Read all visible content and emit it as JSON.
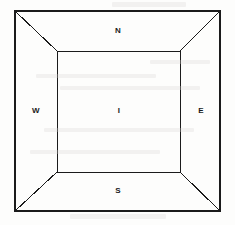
{
  "figure": {
    "kind": "one-point-perspective-room-diagram",
    "background_color": "#fdfdfc",
    "line_color": "#1b1b1b",
    "outer_rect": {
      "x1": 15,
      "y1": 11,
      "x2": 220,
      "y2": 211,
      "stroke_width": 2
    },
    "inner_rect": {
      "x1": 57,
      "y1": 51,
      "x2": 180,
      "y2": 172,
      "stroke_width": 1
    },
    "diagonals": [
      {
        "name": "top-left-diagonal",
        "x1": 15,
        "y1": 11,
        "x2": 57,
        "y2": 51
      },
      {
        "name": "top-right-diagonal",
        "x1": 220,
        "y1": 11,
        "x2": 180,
        "y2": 51
      },
      {
        "name": "bottom-left-diagonal",
        "x1": 15,
        "y1": 211,
        "x2": 57,
        "y2": 172
      },
      {
        "name": "bottom-right-diagonal",
        "x1": 220,
        "y1": 211,
        "x2": 180,
        "y2": 172
      }
    ],
    "labels": [
      {
        "id": "north",
        "text": "N",
        "x": 118,
        "y": 31
      },
      {
        "id": "west",
        "text": "W",
        "x": 36,
        "y": 111
      },
      {
        "id": "interior",
        "text": "I",
        "x": 119,
        "y": 111
      },
      {
        "id": "east",
        "text": "E",
        "x": 201,
        "y": 111
      },
      {
        "id": "south",
        "text": "S",
        "x": 118,
        "y": 191
      }
    ],
    "scan_artifacts": [
      {
        "x": 112,
        "y": 2,
        "w": 74,
        "h": 5
      },
      {
        "x": 70,
        "y": 214,
        "w": 96,
        "h": 5
      },
      {
        "x": 36,
        "y": 74,
        "w": 120,
        "h": 4
      },
      {
        "x": 60,
        "y": 86,
        "w": 140,
        "h": 4
      },
      {
        "x": 44,
        "y": 128,
        "w": 150,
        "h": 4
      },
      {
        "x": 30,
        "y": 150,
        "w": 130,
        "h": 4
      },
      {
        "x": 150,
        "y": 60,
        "w": 60,
        "h": 4
      }
    ]
  }
}
